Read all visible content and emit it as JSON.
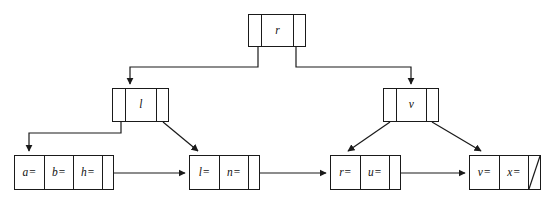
{
  "diagram": {
    "background_color": "#ffffff",
    "stroke_color": "#1a1a1a",
    "width": 546,
    "height": 208,
    "nodes": [
      {
        "id": "root",
        "name": "root-node",
        "label": "r",
        "x": 248,
        "y": 14,
        "width": 58,
        "height": 33,
        "cells": [
          {
            "kind": "pointer",
            "text": ""
          },
          {
            "kind": "key",
            "text": "r"
          },
          {
            "kind": "pointer",
            "text": ""
          }
        ]
      },
      {
        "id": "internal-left",
        "name": "internal-node-l",
        "label": "l",
        "x": 112,
        "y": 88,
        "width": 57,
        "height": 34,
        "cells": [
          {
            "kind": "pointer",
            "text": ""
          },
          {
            "kind": "key",
            "text": "l"
          },
          {
            "kind": "pointer",
            "text": ""
          }
        ]
      },
      {
        "id": "internal-right",
        "name": "internal-node-v",
        "label": "v",
        "x": 383,
        "y": 88,
        "width": 56,
        "height": 34,
        "cells": [
          {
            "kind": "pointer",
            "text": ""
          },
          {
            "kind": "key",
            "text": "v"
          },
          {
            "kind": "pointer",
            "text": ""
          }
        ]
      },
      {
        "id": "leaf-1",
        "name": "leaf-node-1",
        "label": "a= b= h=",
        "x": 14,
        "y": 155,
        "width": 100,
        "height": 35,
        "cells": [
          {
            "kind": "key",
            "text": "a="
          },
          {
            "kind": "key",
            "text": "b="
          },
          {
            "kind": "key",
            "text": "h="
          },
          {
            "kind": "pointer",
            "text": ""
          }
        ]
      },
      {
        "id": "leaf-2",
        "name": "leaf-node-2",
        "label": "l= n=",
        "x": 189,
        "y": 155,
        "width": 71,
        "height": 35,
        "cells": [
          {
            "kind": "key",
            "text": "l="
          },
          {
            "kind": "key",
            "text": "n="
          },
          {
            "kind": "pointer",
            "text": ""
          }
        ]
      },
      {
        "id": "leaf-3",
        "name": "leaf-node-3",
        "label": "r= u=",
        "x": 330,
        "y": 155,
        "width": 71,
        "height": 35,
        "cells": [
          {
            "kind": "key",
            "text": "r="
          },
          {
            "kind": "key",
            "text": "u="
          },
          {
            "kind": "pointer",
            "text": ""
          }
        ]
      },
      {
        "id": "leaf-4",
        "name": "leaf-node-4",
        "label": "v= x=",
        "x": 469,
        "y": 155,
        "width": 72,
        "height": 35,
        "cells": [
          {
            "kind": "key",
            "text": "v="
          },
          {
            "kind": "key",
            "text": "x="
          },
          {
            "kind": "null",
            "text": ""
          }
        ]
      }
    ],
    "edges": [
      {
        "name": "edge-root-to-l",
        "from": "root",
        "to": "internal-left",
        "style": "orthogonal",
        "arrow": "down"
      },
      {
        "name": "edge-root-to-v",
        "from": "root",
        "to": "internal-right",
        "style": "orthogonal",
        "arrow": "down"
      },
      {
        "name": "edge-l-to-leaf1",
        "from": "internal-left",
        "to": "leaf-1",
        "style": "orthogonal",
        "arrow": "down"
      },
      {
        "name": "edge-l-to-leaf2",
        "from": "internal-left",
        "to": "leaf-2",
        "style": "diagonal",
        "arrow": "down-right"
      },
      {
        "name": "edge-v-to-leaf3",
        "from": "internal-right",
        "to": "leaf-3",
        "style": "diagonal",
        "arrow": "down-left"
      },
      {
        "name": "edge-v-to-leaf4",
        "from": "internal-right",
        "to": "leaf-4",
        "style": "diagonal",
        "arrow": "down-right"
      },
      {
        "name": "edge-leaf1-to-leaf2",
        "from": "leaf-1",
        "to": "leaf-2",
        "style": "horizontal",
        "arrow": "right"
      },
      {
        "name": "edge-leaf2-to-leaf3",
        "from": "leaf-2",
        "to": "leaf-3",
        "style": "horizontal",
        "arrow": "right"
      },
      {
        "name": "edge-leaf3-to-leaf4",
        "from": "leaf-3",
        "to": "leaf-4",
        "style": "horizontal",
        "arrow": "right"
      }
    ]
  }
}
